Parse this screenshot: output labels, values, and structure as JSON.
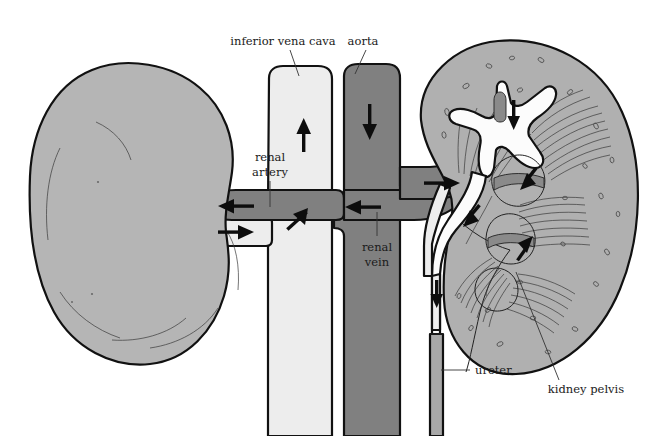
{
  "diagram": {
    "background_color": "#ffffff"
  },
  "colors": {
    "artery_dark_gray": "#808080",
    "vein_light_gray": "#ededed",
    "kidney_gray": "#b5b5b5",
    "kidney_cortex_gray": "#b0b0b0",
    "pelvis_white": "#fcfcfc",
    "ureter_gray": "#a8a8a8",
    "outline_black": "#111111",
    "label_text": "#1a1a1a"
  },
  "labels": [
    {
      "id": "inferior-vena-cava",
      "text": "inferior vena cava",
      "x": 283,
      "y": 45,
      "anchor": "middle",
      "leader": "M 290 50 L 299 76"
    },
    {
      "id": "aorta",
      "text": "aorta",
      "x": 363,
      "y": 45,
      "anchor": "middle",
      "leader": "M 366 50 L 355 76"
    },
    {
      "id": "renal-artery",
      "text": "renal",
      "text2": "artery",
      "x": 270,
      "y": 161,
      "anchor": "middle",
      "leader": "M 270 178 L 270 207"
    },
    {
      "id": "renal-vein",
      "text": "renal",
      "text2": "vein",
      "x": 377,
      "y": 251,
      "anchor": "middle",
      "leader": "M 377 238 L 377 213"
    },
    {
      "id": "ureter",
      "text": "ureter",
      "x": 473,
      "y": 374,
      "anchor": "start",
      "leader": "M 468 370 L 441 370"
    },
    {
      "id": "kidney-pelvis",
      "text": "kidney pelvis",
      "x": 586,
      "y": 390,
      "anchor": "middle",
      "leader": "M 559 378 L 518 273"
    }
  ],
  "flow_arrows": [
    {
      "id": "arrow-vena-cava-up",
      "direction": "up",
      "x": 305,
      "y": 135,
      "meaning": "blood returning to heart"
    },
    {
      "id": "arrow-aorta-down",
      "direction": "down",
      "x": 370,
      "y": 120,
      "meaning": "blood from heart"
    },
    {
      "id": "arrow-left-renal-artery-in",
      "direction": "left",
      "x": 231,
      "y": 206,
      "meaning": "blood into left kidney"
    },
    {
      "id": "arrow-left-renal-vein-out",
      "direction": "right",
      "x": 231,
      "y": 232,
      "meaning": "blood out of left kidney"
    },
    {
      "id": "arrow-vena-cava-junction",
      "direction": "up-right",
      "x": 294,
      "y": 216,
      "meaning": "venous blood joining vena cava"
    },
    {
      "id": "arrow-right-renal-vein-in",
      "direction": "left",
      "x": 357,
      "y": 207,
      "meaning": "blood out of right kidney"
    },
    {
      "id": "arrow-right-renal-artery-out",
      "direction": "right",
      "x": 438,
      "y": 183,
      "meaning": "blood into right kidney"
    },
    {
      "id": "arrow-pelvis-down",
      "direction": "down",
      "x": 514,
      "y": 112,
      "meaning": "urine flow in pelvis"
    },
    {
      "id": "arrow-pelvis-down-left",
      "direction": "down-left",
      "x": 532,
      "y": 175,
      "meaning": "urine flow"
    },
    {
      "id": "arrow-calyx-left",
      "direction": "down-left",
      "x": 474,
      "y": 212,
      "meaning": "urine flow"
    },
    {
      "id": "arrow-calyx-up",
      "direction": "up-right",
      "x": 523,
      "y": 248,
      "meaning": "urine flow"
    },
    {
      "id": "arrow-ureter-down",
      "direction": "down",
      "x": 438,
      "y": 292,
      "meaning": "urine to bladder"
    }
  ],
  "structures": [
    {
      "id": "left-kidney",
      "name": "left kidney (external view)"
    },
    {
      "id": "right-kidney",
      "name": "right kidney (sectioned view)"
    },
    {
      "id": "inferior-vena-cava-vessel",
      "name": "inferior vena cava"
    },
    {
      "id": "aorta-vessel",
      "name": "aorta"
    },
    {
      "id": "left-renal-artery",
      "name": "left renal artery"
    },
    {
      "id": "left-renal-vein",
      "name": "left renal vein"
    },
    {
      "id": "right-renal-artery",
      "name": "right renal artery"
    },
    {
      "id": "right-renal-vein",
      "name": "right renal vein"
    },
    {
      "id": "kidney-pelvis-cavity",
      "name": "kidney pelvis"
    },
    {
      "id": "ureter-tube",
      "name": "ureter"
    },
    {
      "id": "renal-pyramids",
      "name": "renal pyramids"
    }
  ]
}
